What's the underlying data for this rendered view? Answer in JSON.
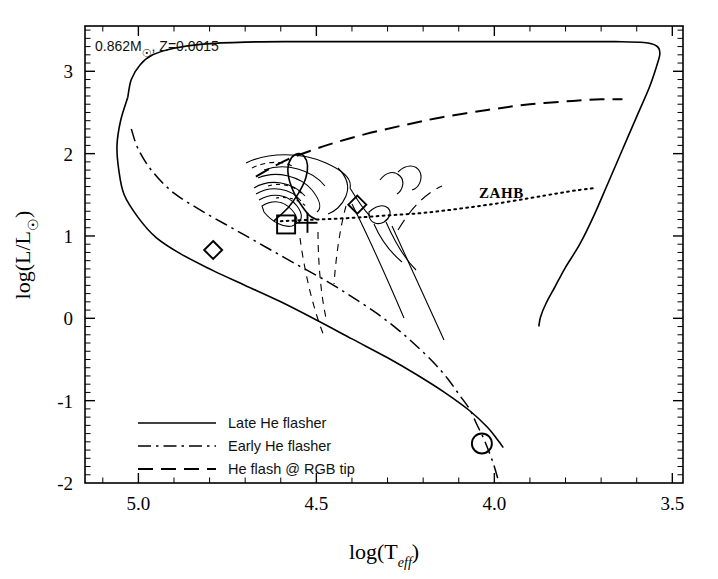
{
  "figure": {
    "kind": "hr-diagram",
    "background": "#ffffff",
    "ink_color": "#000000"
  },
  "annotations": {
    "model_label": "0.862M☉, Z=0.0015",
    "model_label_parts": {
      "mass": "0.862M",
      "sun_symbol": "☉",
      "metallicity": ", Z=0.0015"
    },
    "zahb_label": "ZAHB"
  },
  "legend": {
    "position": "lower-left",
    "entries": [
      {
        "label": "Late He flasher",
        "style": "solid"
      },
      {
        "label": "Early He flasher",
        "style": "dash-dot"
      },
      {
        "label": "He flash @ RGB tip",
        "style": "long-dash"
      }
    ]
  },
  "chart_data": {
    "type": "line",
    "title": "",
    "subtitle": "",
    "xlabel": "log(T_eff)",
    "xlabel_parts": {
      "prefix": "log(T",
      "sub": "eff",
      "suffix": ")"
    },
    "ylabel": "log(L/L☉)",
    "ylabel_parts": {
      "prefix": "log(L/L",
      "sub_symbol": "☉",
      "suffix": ")"
    },
    "xlim": [
      5.15,
      3.47
    ],
    "ylim": [
      -2.0,
      3.55
    ],
    "x_ticks_major": [
      5.0,
      4.5,
      4.0,
      3.5
    ],
    "x_tick_labels": [
      "5.0",
      "4.5",
      "4.0",
      "3.5"
    ],
    "x_minor_step": 0.1,
    "y_ticks_major": [
      -2,
      -1,
      0,
      1,
      2,
      3
    ],
    "y_tick_labels": [
      "-2",
      "-1",
      "0",
      "1",
      "2",
      "3"
    ],
    "y_minor_step": 0.1,
    "x_axis_inverted": true,
    "grid": false,
    "legend_position": "lower left",
    "series": [
      {
        "name": "Late He flasher",
        "style": "solid",
        "points": [
          [
            5.03,
            2.68
          ],
          [
            5.02,
            2.9
          ],
          [
            4.995,
            3.08
          ],
          [
            4.96,
            3.2
          ],
          [
            4.9,
            3.28
          ],
          [
            4.82,
            3.33
          ],
          [
            4.7,
            3.355
          ],
          [
            4.55,
            3.36
          ],
          [
            4.4,
            3.36
          ],
          [
            4.2,
            3.36
          ],
          [
            4.0,
            3.36
          ],
          [
            3.8,
            3.36
          ],
          [
            3.66,
            3.36
          ],
          [
            3.58,
            3.35
          ],
          [
            3.545,
            3.31
          ],
          [
            3.535,
            3.22
          ],
          [
            3.545,
            3.05
          ],
          [
            3.565,
            2.8
          ],
          [
            3.6,
            2.45
          ],
          [
            3.64,
            2.05
          ],
          [
            3.68,
            1.65
          ],
          [
            3.72,
            1.25
          ],
          [
            3.76,
            0.9
          ],
          [
            3.8,
            0.62
          ],
          [
            3.83,
            0.38
          ],
          [
            3.855,
            0.18
          ],
          [
            3.87,
            0.02
          ],
          [
            3.875,
            -0.1
          ]
        ]
      },
      {
        "name": "Late He flasher (secondary/MS)",
        "style": "solid",
        "points": [
          [
            5.03,
            2.68
          ],
          [
            5.05,
            2.4
          ],
          [
            5.06,
            2.1
          ],
          [
            5.055,
            1.8
          ],
          [
            5.04,
            1.5
          ],
          [
            5.0,
            1.22
          ],
          [
            4.95,
            0.98
          ],
          [
            4.88,
            0.78
          ],
          [
            4.79,
            0.58
          ],
          [
            4.7,
            0.4
          ],
          [
            4.6,
            0.2
          ],
          [
            4.5,
            -0.02
          ],
          [
            4.4,
            -0.25
          ],
          [
            4.3,
            -0.48
          ],
          [
            4.22,
            -0.68
          ],
          [
            4.14,
            -0.9
          ],
          [
            4.07,
            -1.12
          ],
          [
            4.02,
            -1.32
          ],
          [
            3.99,
            -1.48
          ],
          [
            3.975,
            -1.57
          ]
        ]
      },
      {
        "name": "Early He flasher",
        "style": "dash-dot",
        "points": [
          [
            5.02,
            2.3
          ],
          [
            5.0,
            2.05
          ],
          [
            4.96,
            1.78
          ],
          [
            4.9,
            1.52
          ],
          [
            4.82,
            1.3
          ],
          [
            4.73,
            1.08
          ],
          [
            4.64,
            0.86
          ],
          [
            4.55,
            0.64
          ],
          [
            4.47,
            0.45
          ],
          [
            4.4,
            0.26
          ],
          [
            4.33,
            0.06
          ],
          [
            4.27,
            -0.14
          ],
          [
            4.22,
            -0.33
          ],
          [
            4.17,
            -0.54
          ],
          [
            4.13,
            -0.74
          ],
          [
            4.1,
            -0.92
          ],
          [
            4.07,
            -1.1
          ],
          [
            4.05,
            -1.28
          ],
          [
            4.03,
            -1.46
          ],
          [
            4.015,
            -1.62
          ],
          [
            4.0,
            -1.8
          ],
          [
            3.99,
            -1.95
          ],
          [
            3.985,
            -2.0
          ]
        ]
      },
      {
        "name": "He flash @ RGB tip",
        "style": "long-dash",
        "points": [
          [
            4.67,
            1.72
          ],
          [
            4.63,
            1.82
          ],
          [
            4.58,
            1.93
          ],
          [
            4.52,
            2.03
          ],
          [
            4.45,
            2.13
          ],
          [
            4.36,
            2.24
          ],
          [
            4.26,
            2.34
          ],
          [
            4.15,
            2.44
          ],
          [
            4.02,
            2.53
          ],
          [
            3.9,
            2.6
          ],
          [
            3.78,
            2.64
          ],
          [
            3.7,
            2.66
          ],
          [
            3.64,
            2.66
          ]
        ]
      },
      {
        "name": "ZAHB",
        "style": "dotted",
        "points": [
          [
            4.6,
            1.18
          ],
          [
            4.5,
            1.2
          ],
          [
            4.4,
            1.22
          ],
          [
            4.3,
            1.25
          ],
          [
            4.2,
            1.28
          ],
          [
            4.1,
            1.33
          ],
          [
            4.0,
            1.39
          ],
          [
            3.9,
            1.46
          ],
          [
            3.82,
            1.52
          ],
          [
            3.76,
            1.56
          ],
          [
            3.72,
            1.58
          ]
        ]
      },
      {
        "name": "HB loop (late flasher)",
        "style": "solid",
        "points": [
          [
            4.62,
            1.18
          ],
          [
            4.58,
            1.34
          ],
          [
            4.55,
            1.52
          ],
          [
            4.53,
            1.7
          ],
          [
            4.525,
            1.86
          ],
          [
            4.535,
            1.97
          ],
          [
            4.55,
            2.0
          ],
          [
            4.57,
            1.95
          ],
          [
            4.58,
            1.82
          ],
          [
            4.575,
            1.66
          ],
          [
            4.56,
            1.5
          ],
          [
            4.54,
            1.36
          ],
          [
            4.52,
            1.25
          ],
          [
            4.5,
            1.2
          ]
        ]
      }
    ],
    "markers": [
      {
        "name": "diamond-low-left",
        "symbol": "diamond",
        "x": 4.79,
        "y": 0.83
      },
      {
        "name": "square-mid",
        "symbol": "square",
        "x": 4.585,
        "y": 1.14
      },
      {
        "name": "plus-mid",
        "symbol": "plus",
        "x": 4.525,
        "y": 1.16
      },
      {
        "name": "diamond-mid-right",
        "symbol": "diamond",
        "x": 4.385,
        "y": 1.38
      },
      {
        "name": "circle-lower-right",
        "symbol": "circle",
        "x": 4.035,
        "y": -1.52
      }
    ]
  }
}
